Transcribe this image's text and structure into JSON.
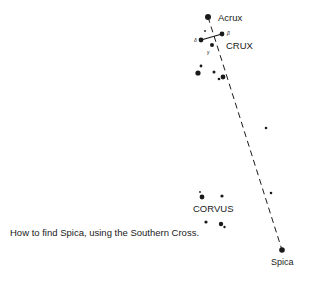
{
  "diagram": {
    "caption": "How to find Spica, using the Southern Cross.",
    "labels": {
      "acrux": "Acrux",
      "crux": "CRUX",
      "corvus": "CORVUS",
      "spica": "Spica",
      "beta": "β",
      "delta": "δ",
      "gamma": "γ"
    },
    "pointer_line": {
      "from": "Acrux",
      "to": "Spica",
      "style": "dashed"
    },
    "colors": {
      "ink": "#1a1a1a",
      "background": "#ffffff"
    }
  }
}
